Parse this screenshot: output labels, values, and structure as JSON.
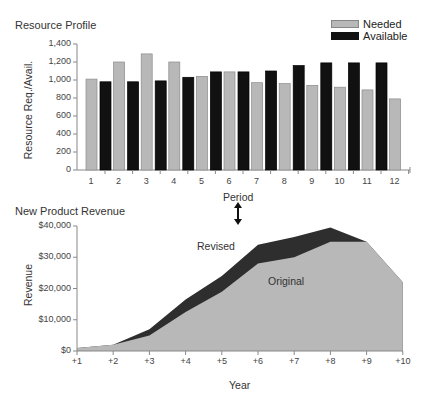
{
  "chart_data": [
    {
      "type": "bar",
      "title": "Resource Profile",
      "xlabel": "Period",
      "ylabel": "Resource Req./Avail.",
      "ylim": [
        0,
        1400
      ],
      "yticks": [
        "0",
        "200",
        "400",
        "600",
        "800",
        "1,000",
        "1,200",
        "1,400"
      ],
      "categories": [
        "1",
        "2",
        "3",
        "4",
        "5",
        "6",
        "7",
        "8",
        "9",
        "10",
        "11",
        "12"
      ],
      "series": [
        {
          "name": "Needed",
          "color": "#b8b8b8",
          "values": [
            1010,
            1200,
            1290,
            1200,
            1040,
            1090,
            970,
            960,
            940,
            920,
            890,
            790
          ]
        },
        {
          "name": "Available",
          "color": "#111111",
          "values": [
            980,
            980,
            990,
            1030,
            1090,
            1090,
            1100,
            1160,
            1190,
            1190,
            1190,
            null
          ]
        }
      ],
      "legend_position": "top-right",
      "grid": false
    },
    {
      "type": "area",
      "title": "New Product Revenue",
      "xlabel": "Year",
      "ylabel": "Revenue",
      "ylim": [
        0,
        40000
      ],
      "yticks": [
        "$0",
        "$10,000",
        "$20,000",
        "$30,000",
        "$40,000"
      ],
      "x": [
        "+1",
        "+2",
        "+3",
        "+4",
        "+5",
        "+6",
        "+7",
        "+8",
        "+9",
        "+10"
      ],
      "series": [
        {
          "name": "Original",
          "color": "#b8b8b8",
          "values": [
            1000,
            2000,
            5000,
            12500,
            19000,
            28000,
            30000,
            35000,
            35000,
            22000
          ]
        },
        {
          "name": "Revised",
          "color": "#2e2e2e",
          "values": [
            1000,
            2000,
            7000,
            16500,
            24000,
            34000,
            36500,
            39500,
            35000,
            22000
          ]
        }
      ],
      "annotations": [
        "Revised",
        "Original"
      ],
      "grid": false
    }
  ],
  "connector": {
    "label": "Period",
    "icon": "double-arrow-vertical-icon"
  }
}
